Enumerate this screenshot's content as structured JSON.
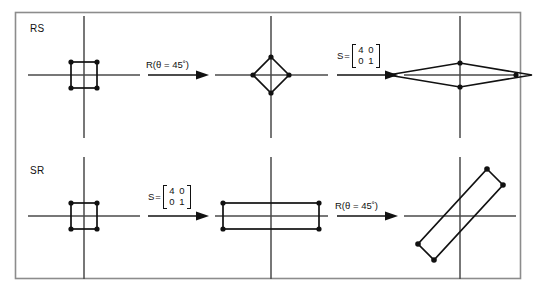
{
  "figure": {
    "caption_visible": false,
    "border_color": "#8c8c8c",
    "stroke_color": "#111111",
    "axis_color": "#4a4a4a",
    "background": "#ffffff",
    "rows": [
      {
        "id": "rs",
        "label": "RS",
        "steps": [
          {
            "kind": "shape",
            "name": "unit-square"
          },
          {
            "kind": "operator",
            "name": "rotation",
            "text": "R(θ = 45˚)"
          },
          {
            "kind": "shape",
            "name": "rotated-square-diamond"
          },
          {
            "kind": "operator",
            "name": "scale",
            "symbol": "S",
            "equals": "=",
            "matrix": [
              [
                "4",
                "0"
              ],
              [
                "0",
                "1"
              ]
            ]
          },
          {
            "kind": "shape",
            "name": "scaled-diamond"
          }
        ]
      },
      {
        "id": "sr",
        "label": "SR",
        "steps": [
          {
            "kind": "shape",
            "name": "unit-square"
          },
          {
            "kind": "operator",
            "name": "scale",
            "symbol": "S",
            "equals": "=",
            "matrix": [
              [
                "4",
                "0"
              ],
              [
                "0",
                "1"
              ]
            ]
          },
          {
            "kind": "shape",
            "name": "scaled-rectangle"
          },
          {
            "kind": "operator",
            "name": "rotation",
            "text": "R(θ = 45˚)"
          },
          {
            "kind": "shape",
            "name": "rotated-rectangle"
          }
        ]
      }
    ]
  },
  "labels": {
    "row_rs": "RS",
    "row_sr": "SR",
    "rotation_top": "R(θ = 45˚)",
    "rotation_bottom": "R(θ = 45˚)",
    "matrix_symbol_top": "S",
    "matrix_equals_top": "=",
    "matrix_symbol_bottom": "S",
    "matrix_equals_bottom": "=",
    "m_top_r0c0": "4",
    "m_top_r0c1": "0",
    "m_top_r1c0": "0",
    "m_top_r1c1": "1",
    "m_bot_r0c0": "4",
    "m_bot_r0c1": "0",
    "m_bot_r1c0": "0",
    "m_bot_r1c1": "1"
  }
}
